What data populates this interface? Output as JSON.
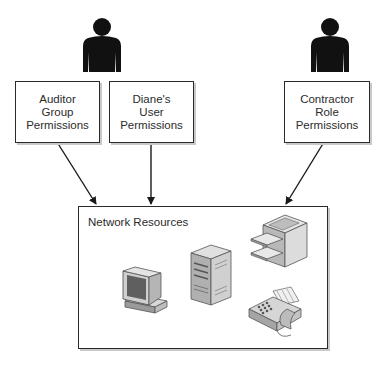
{
  "diagram": {
    "users": [
      {
        "name": "person-auditor-diane",
        "icon": "person-icon"
      },
      {
        "name": "person-contractor",
        "icon": "person-icon"
      }
    ],
    "permission_boxes": [
      {
        "lines": [
          "Auditor",
          "Group",
          "Permissions"
        ]
      },
      {
        "lines": [
          "Diane's",
          "User",
          "Permissions"
        ]
      },
      {
        "lines": [
          "Contractor",
          "Role",
          "Permissions"
        ]
      }
    ],
    "network": {
      "title": "Network Resources",
      "devices": [
        "workstation-icon",
        "server-icon",
        "printer-icon",
        "fax-machine-icon"
      ]
    },
    "colors": {
      "stroke": "#2a2a2a",
      "text": "#2b2b2b",
      "person": "#111111",
      "shadow": "#c9c9c9"
    }
  }
}
